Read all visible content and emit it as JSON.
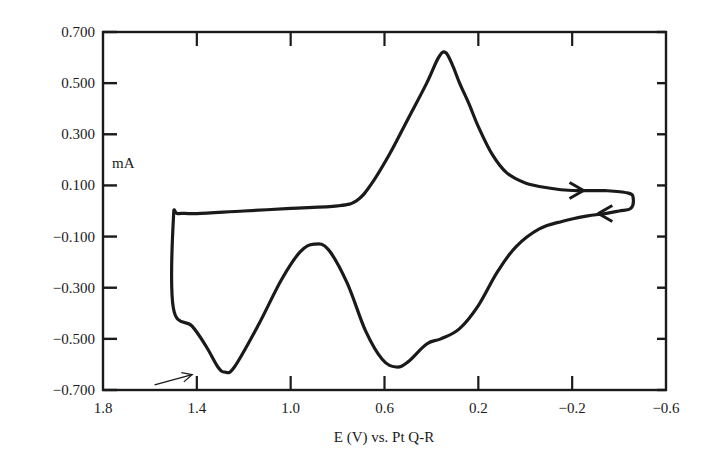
{
  "chart_data": {
    "type": "line",
    "title": "",
    "xlabel": "E (V) vs. Pt Q-R",
    "ylabel": "mA",
    "xlim": [
      1.8,
      -0.6
    ],
    "ylim": [
      -0.7,
      0.7
    ],
    "x_reversed": true,
    "grid": false,
    "legend": null,
    "x_ticks": [
      1.8,
      1.4,
      1.0,
      0.6,
      0.2,
      -0.2,
      -0.6
    ],
    "x_tick_labels": [
      "1.8",
      "1.4",
      "1.0",
      "0.6",
      "0.2",
      "−0.2",
      "−0.6"
    ],
    "y_ticks": [
      0.7,
      0.5,
      0.3,
      0.1,
      -0.1,
      -0.3,
      -0.5,
      -0.7
    ],
    "y_tick_labels": [
      "0.700",
      "0.500",
      "0.300",
      "0.100",
      "−0.100",
      "−0.300",
      "−0.500",
      "−0.700"
    ],
    "series": [
      {
        "name": "cyclic voltammogram",
        "color": "#1a1a1a",
        "points": [
          [
            -0.34,
            0.08
          ],
          [
            -0.2,
            0.08
          ],
          [
            -0.1,
            0.09
          ],
          [
            0.0,
            0.11
          ],
          [
            0.08,
            0.15
          ],
          [
            0.14,
            0.22
          ],
          [
            0.2,
            0.33
          ],
          [
            0.24,
            0.42
          ],
          [
            0.28,
            0.5
          ],
          [
            0.31,
            0.57
          ],
          [
            0.34,
            0.62
          ],
          [
            0.37,
            0.6
          ],
          [
            0.42,
            0.5
          ],
          [
            0.5,
            0.36
          ],
          [
            0.58,
            0.22
          ],
          [
            0.66,
            0.1
          ],
          [
            0.72,
            0.04
          ],
          [
            0.8,
            0.02
          ],
          [
            1.0,
            0.01
          ],
          [
            1.2,
            0.0
          ],
          [
            1.4,
            -0.01
          ],
          [
            1.48,
            -0.01
          ],
          [
            1.5,
            -0.03
          ],
          [
            1.5,
            -0.38
          ],
          [
            1.42,
            -0.45
          ],
          [
            1.36,
            -0.53
          ],
          [
            1.31,
            -0.61
          ],
          [
            1.28,
            -0.63
          ],
          [
            1.24,
            -0.61
          ],
          [
            1.14,
            -0.45
          ],
          [
            1.04,
            -0.27
          ],
          [
            0.96,
            -0.16
          ],
          [
            0.9,
            -0.13
          ],
          [
            0.84,
            -0.15
          ],
          [
            0.76,
            -0.28
          ],
          [
            0.68,
            -0.47
          ],
          [
            0.61,
            -0.58
          ],
          [
            0.55,
            -0.61
          ],
          [
            0.5,
            -0.59
          ],
          [
            0.42,
            -0.52
          ],
          [
            0.36,
            -0.5
          ],
          [
            0.28,
            -0.46
          ],
          [
            0.2,
            -0.37
          ],
          [
            0.12,
            -0.24
          ],
          [
            0.04,
            -0.14
          ],
          [
            -0.06,
            -0.07
          ],
          [
            -0.16,
            -0.04
          ],
          [
            -0.26,
            -0.02
          ],
          [
            -0.34,
            -0.01
          ],
          [
            -0.4,
            0.0
          ],
          [
            -0.45,
            0.01
          ],
          [
            -0.46,
            0.05
          ],
          [
            -0.44,
            0.07
          ],
          [
            -0.34,
            0.08
          ]
        ]
      }
    ],
    "annotations": [
      {
        "type": "arrow",
        "text": "",
        "description": "arrow pointing at cathodic peak near 1.3 V",
        "from": [
          1.58,
          -0.68
        ],
        "to": [
          1.42,
          -0.64
        ]
      },
      {
        "type": "direction-arrow",
        "text": "",
        "description": "scan direction arrow pointing toward negative potential on upper branch",
        "at": [
          -0.24,
          0.08
        ]
      },
      {
        "type": "direction-arrow",
        "text": "",
        "description": "scan direction arrow pointing toward positive potential on lower branch",
        "at": [
          -0.32,
          -0.01
        ]
      }
    ]
  }
}
